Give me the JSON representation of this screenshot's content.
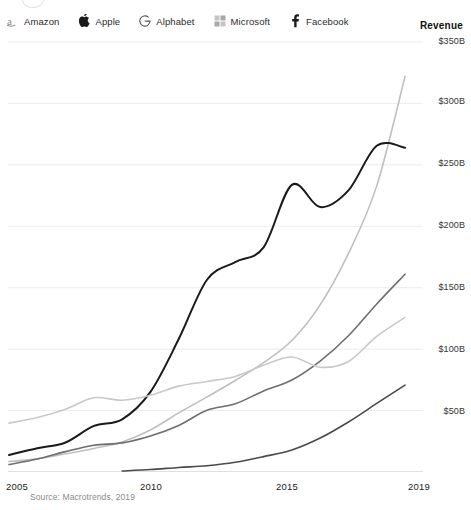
{
  "legend": {
    "revenue_label": "Revenue",
    "items": [
      {
        "label": "Amazon",
        "icon": "amazon-logo-icon",
        "color": "#bfbfbf"
      },
      {
        "label": "Apple",
        "icon": "apple-logo-icon",
        "color": "#1a1a1a"
      },
      {
        "label": "Alphabet",
        "icon": "google-g-logo-icon",
        "color": "#6e6e6e"
      },
      {
        "label": "Microsoft",
        "icon": "microsoft-logo-icon",
        "color": "#c9c9c9"
      },
      {
        "label": "Facebook",
        "icon": "facebook-f-logo-icon",
        "color": "#4a4a4a"
      }
    ]
  },
  "source": {
    "text": "Source: Macrotrends, 2019"
  },
  "chart_data": {
    "type": "line",
    "title": "Revenue",
    "xlabel": "",
    "ylabel": "Revenue",
    "grid": true,
    "legend_position": "top",
    "xlim": [
      2005,
      2019.6
    ],
    "ylim": [
      0,
      350
    ],
    "yticks": [
      50,
      100,
      150,
      200,
      250,
      300,
      350
    ],
    "ytick_labels": [
      "$50B",
      "$100B",
      "$150B",
      "$200B",
      "$250B",
      "$300B",
      "$350B"
    ],
    "xticks": [
      2005,
      2010,
      2015,
      2019
    ],
    "xtick_labels": [
      "2005",
      "2010",
      "2015",
      "2019"
    ],
    "units": "billions of USD",
    "x": [
      2005,
      2006,
      2007,
      2008,
      2009,
      2010,
      2011,
      2012,
      2013,
      2014,
      2015,
      2016,
      2017,
      2018,
      2019
    ],
    "series": [
      {
        "name": "Amazon",
        "color": "#bfbfbf",
        "values": [
          8.5,
          10.7,
          14.8,
          19.2,
          24.5,
          34.2,
          48.1,
          61.1,
          74.5,
          89.0,
          107.0,
          136.0,
          177.9,
          232.9,
          322.0
        ]
      },
      {
        "name": "Apple",
        "color": "#1a1a1a",
        "values": [
          13.9,
          19.3,
          24.0,
          37.5,
          42.9,
          65.2,
          108.2,
          156.5,
          170.9,
          182.8,
          233.7,
          215.6,
          229.2,
          265.6,
          264.0
        ]
      },
      {
        "name": "Alphabet",
        "color": "#6e6e6e",
        "values": [
          6.1,
          10.6,
          16.6,
          21.8,
          23.7,
          29.3,
          37.9,
          50.2,
          55.5,
          66.0,
          74.9,
          90.3,
          110.9,
          136.8,
          161.0
        ]
      },
      {
        "name": "Microsoft",
        "color": "#c9c9c9",
        "values": [
          39.8,
          44.3,
          51.1,
          60.4,
          58.4,
          62.5,
          69.9,
          73.7,
          77.8,
          86.8,
          93.6,
          85.3,
          90.0,
          110.4,
          125.8
        ]
      },
      {
        "name": "Facebook",
        "color": "#4a4a4a",
        "values": [
          0,
          0,
          0,
          0,
          0.8,
          2.0,
          3.7,
          5.1,
          7.9,
          12.5,
          17.9,
          27.6,
          40.7,
          55.8,
          70.7
        ]
      }
    ]
  }
}
